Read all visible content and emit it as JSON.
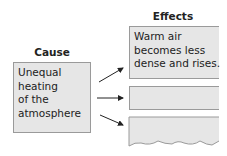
{
  "cause": {
    "title": "Cause",
    "lines": [
      "Unequal",
      "heating",
      "of the",
      "atmosphere"
    ]
  },
  "effects": {
    "title": "Effects",
    "items": [
      {
        "lines": [
          "Warm air",
          "becomes less",
          "dense and rises."
        ]
      },
      {
        "lines": []
      },
      {
        "lines": []
      }
    ]
  }
}
